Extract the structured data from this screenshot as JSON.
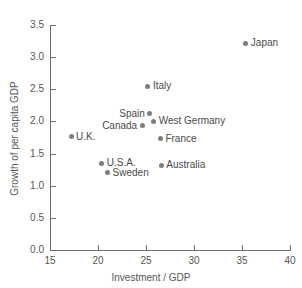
{
  "chart_data": {
    "type": "scatter",
    "title": "",
    "subtitle": "",
    "xlabel": "Investment / GDP",
    "ylabel": "Growth of per capita GDP",
    "xlim": [
      15,
      40
    ],
    "ylim": [
      0.0,
      3.5
    ],
    "xticks": [
      15,
      20,
      25,
      30,
      35,
      40
    ],
    "yticks": [
      0.0,
      0.5,
      1.0,
      1.5,
      2.0,
      2.5,
      3.0,
      3.5
    ],
    "xtick_labels": [
      "15",
      "20",
      "25",
      "30",
      "35",
      "40"
    ],
    "ytick_labels": [
      "0.0",
      "0.5",
      "1.0",
      "1.5",
      "2.0",
      "2.5",
      "3.0",
      "3.5"
    ],
    "grid": false,
    "legend": null,
    "marker_color": "#7d7d7d",
    "axis_color": "#6e6e6e",
    "text_color": "#555555",
    "points": [
      {
        "label": "Japan",
        "x": 35.4,
        "y": 3.22,
        "label_side": "right"
      },
      {
        "label": "Italy",
        "x": 25.2,
        "y": 2.55,
        "label_side": "right"
      },
      {
        "label": "Spain",
        "x": 25.4,
        "y": 2.12,
        "label_side": "left"
      },
      {
        "label": "West Germany",
        "x": 25.8,
        "y": 2.0,
        "label_side": "right"
      },
      {
        "label": "Canada",
        "x": 24.6,
        "y": 1.93,
        "label_side": "left"
      },
      {
        "label": "France",
        "x": 26.5,
        "y": 1.73,
        "label_side": "right"
      },
      {
        "label": "U.K.",
        "x": 17.2,
        "y": 1.76,
        "label_side": "right"
      },
      {
        "label": "U.S.A.",
        "x": 20.4,
        "y": 1.35,
        "label_side": "right"
      },
      {
        "label": "Australia",
        "x": 26.6,
        "y": 1.32,
        "label_side": "right"
      },
      {
        "label": "Sweden",
        "x": 21.0,
        "y": 1.2,
        "label_side": "right"
      }
    ]
  }
}
